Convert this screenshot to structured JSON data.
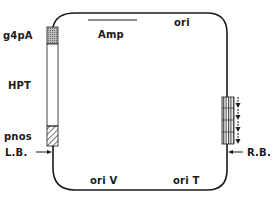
{
  "diagram": {
    "type": "plasmid-map",
    "colors": {
      "line": "#1a1a1a",
      "background": "#ffffff",
      "stipple": "#9a9a9a"
    },
    "labels": {
      "g4pA": "g4pA",
      "hpt": "HPT",
      "pnos": "pnos",
      "lb": "L.B.",
      "rb": "R.B.",
      "amp": "Amp",
      "ori": "ori",
      "oriV": "ori V",
      "oriT": "ori T"
    },
    "features": [
      {
        "name": "g4pA",
        "style": "stippled"
      },
      {
        "name": "HPT",
        "style": "open"
      },
      {
        "name": "pnos",
        "style": "hatched"
      },
      {
        "name": "R.B. repeat",
        "style": "vertical-hatched",
        "arrows": 4,
        "direction": "down"
      },
      {
        "name": "Amp",
        "style": "line-segment"
      }
    ]
  }
}
